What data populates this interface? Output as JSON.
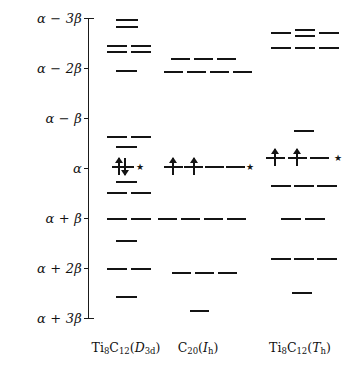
{
  "figure": {
    "type": "energy-level-diagram",
    "width": 358,
    "height": 375,
    "background": "#ffffff",
    "ink_color": "#141414"
  },
  "axis": {
    "name": "energy-axis",
    "orientation": "vertical",
    "x_px": 88,
    "top_px": 18,
    "bottom_px": 318,
    "unit_beta_px": 50,
    "alpha_y_px": 168,
    "ticks": [
      {
        "label": "α − 3β",
        "value_beta": -3,
        "y_px": 18
      },
      {
        "label": "α − 2β",
        "value_beta": -2,
        "y_px": 68
      },
      {
        "label": "α − β",
        "value_beta": -1,
        "y_px": 118
      },
      {
        "label": "α",
        "value_beta": 0,
        "y_px": 168
      },
      {
        "label": "α + β",
        "value_beta": 1,
        "y_px": 218
      },
      {
        "label": "α + 2β",
        "value_beta": 2,
        "y_px": 268
      },
      {
        "label": "α + 3β",
        "value_beta": 3,
        "y_px": 318
      }
    ]
  },
  "columns": [
    {
      "id": "col-ti8c12-d3d",
      "caption": "Ti₈C₁₂(D₃ᵈ)",
      "caption_parts": {
        "formula": "Ti8C12",
        "symmetry": "D3d"
      },
      "center_x_px": 126,
      "levels": [
        {
          "y_px": 19,
          "x_px": 116,
          "w_px": 22
        },
        {
          "y_px": 26,
          "x_px": 116,
          "w_px": 22
        },
        {
          "y_px": 45,
          "x_px": 107,
          "w_px": 20
        },
        {
          "y_px": 51,
          "x_px": 107,
          "w_px": 20
        },
        {
          "y_px": 45,
          "x_px": 131,
          "w_px": 20
        },
        {
          "y_px": 51,
          "x_px": 131,
          "w_px": 20
        },
        {
          "y_px": 70,
          "x_px": 116,
          "w_px": 21
        },
        {
          "y_px": 136,
          "x_px": 107,
          "w_px": 20
        },
        {
          "y_px": 136,
          "x_px": 131,
          "w_px": 20
        },
        {
          "y_px": 146,
          "x_px": 116,
          "w_px": 21
        },
        {
          "y_px": 166,
          "x_px": 112,
          "w_px": 22
        },
        {
          "y_px": 181,
          "x_px": 116,
          "w_px": 21
        },
        {
          "y_px": 192,
          "x_px": 107,
          "w_px": 20
        },
        {
          "y_px": 192,
          "x_px": 131,
          "w_px": 20
        },
        {
          "y_px": 218,
          "x_px": 107,
          "w_px": 20
        },
        {
          "y_px": 218,
          "x_px": 131,
          "w_px": 20
        },
        {
          "y_px": 240,
          "x_px": 116,
          "w_px": 21
        },
        {
          "y_px": 268,
          "x_px": 107,
          "w_px": 20
        },
        {
          "y_px": 268,
          "x_px": 131,
          "w_px": 20
        },
        {
          "y_px": 296,
          "x_px": 116,
          "w_px": 21
        }
      ],
      "arrows": [
        {
          "direction": "up",
          "x_px": 118,
          "y_px": 166
        },
        {
          "direction": "down",
          "x_px": 124,
          "y_px": 166
        }
      ],
      "stars": [
        {
          "x_px": 140,
          "y_px": 167
        }
      ]
    },
    {
      "id": "col-c20-ih",
      "caption": "C₂₀(Iₕ)",
      "caption_parts": {
        "formula": "C20",
        "symmetry": "Ih"
      },
      "center_x_px": 198,
      "levels": [
        {
          "y_px": 58,
          "x_px": 171,
          "w_px": 19
        },
        {
          "y_px": 58,
          "x_px": 194,
          "w_px": 19
        },
        {
          "y_px": 58,
          "x_px": 217,
          "w_px": 19
        },
        {
          "y_px": 71,
          "x_px": 164,
          "w_px": 19
        },
        {
          "y_px": 71,
          "x_px": 187,
          "w_px": 19
        },
        {
          "y_px": 71,
          "x_px": 210,
          "w_px": 19
        },
        {
          "y_px": 71,
          "x_px": 233,
          "w_px": 19
        },
        {
          "y_px": 166,
          "x_px": 164,
          "w_px": 19
        },
        {
          "y_px": 166,
          "x_px": 184,
          "w_px": 19
        },
        {
          "y_px": 166,
          "x_px": 205,
          "w_px": 19
        },
        {
          "y_px": 166,
          "x_px": 226,
          "w_px": 19
        },
        {
          "y_px": 218,
          "x_px": 158,
          "w_px": 19
        },
        {
          "y_px": 218,
          "x_px": 181,
          "w_px": 19
        },
        {
          "y_px": 218,
          "x_px": 204,
          "w_px": 19
        },
        {
          "y_px": 218,
          "x_px": 227,
          "w_px": 19
        },
        {
          "y_px": 272,
          "x_px": 172,
          "w_px": 19
        },
        {
          "y_px": 272,
          "x_px": 195,
          "w_px": 19
        },
        {
          "y_px": 272,
          "x_px": 218,
          "w_px": 19
        },
        {
          "y_px": 310,
          "x_px": 190,
          "w_px": 19
        }
      ],
      "arrows": [
        {
          "direction": "up",
          "x_px": 172,
          "y_px": 166
        },
        {
          "direction": "up",
          "x_px": 193,
          "y_px": 166
        }
      ],
      "stars": [
        {
          "x_px": 250,
          "y_px": 167
        }
      ]
    },
    {
      "id": "col-ti8c12-th",
      "caption": "Ti₈C₁₂(Tₕ)",
      "caption_parts": {
        "formula": "Ti8C12",
        "symmetry": "Th"
      },
      "center_x_px": 300,
      "levels": [
        {
          "y_px": 32,
          "x_px": 271,
          "w_px": 20
        },
        {
          "y_px": 29,
          "x_px": 295,
          "w_px": 20
        },
        {
          "y_px": 35,
          "x_px": 295,
          "w_px": 20
        },
        {
          "y_px": 32,
          "x_px": 319,
          "w_px": 20
        },
        {
          "y_px": 47,
          "x_px": 271,
          "w_px": 20
        },
        {
          "y_px": 47,
          "x_px": 295,
          "w_px": 20
        },
        {
          "y_px": 47,
          "x_px": 319,
          "w_px": 20
        },
        {
          "y_px": 130,
          "x_px": 294,
          "w_px": 20
        },
        {
          "y_px": 157,
          "x_px": 266,
          "w_px": 19
        },
        {
          "y_px": 157,
          "x_px": 288,
          "w_px": 19
        },
        {
          "y_px": 157,
          "x_px": 310,
          "w_px": 19
        },
        {
          "y_px": 185,
          "x_px": 271,
          "w_px": 20
        },
        {
          "y_px": 185,
          "x_px": 294,
          "w_px": 20
        },
        {
          "y_px": 185,
          "x_px": 317,
          "w_px": 20
        },
        {
          "y_px": 218,
          "x_px": 281,
          "w_px": 20
        },
        {
          "y_px": 218,
          "x_px": 305,
          "w_px": 20
        },
        {
          "y_px": 258,
          "x_px": 271,
          "w_px": 20
        },
        {
          "y_px": 258,
          "x_px": 294,
          "w_px": 20
        },
        {
          "y_px": 258,
          "x_px": 317,
          "w_px": 20
        },
        {
          "y_px": 292,
          "x_px": 292,
          "w_px": 20
        }
      ],
      "arrows": [
        {
          "direction": "up",
          "x_px": 274,
          "y_px": 157
        },
        {
          "direction": "up",
          "x_px": 296,
          "y_px": 157
        }
      ],
      "stars": [
        {
          "x_px": 338,
          "y_px": 158
        }
      ]
    }
  ]
}
